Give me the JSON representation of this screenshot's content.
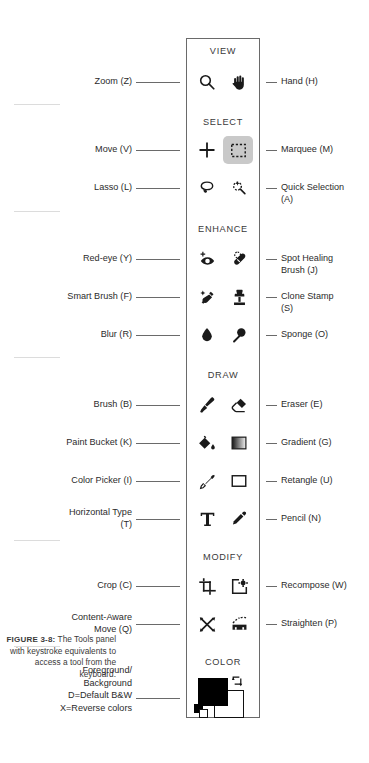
{
  "figure": {
    "number": "FIGURE 3-8:",
    "caption": "The Tools panel with keystroke equivalents to access a tool from the keyboard."
  },
  "panel": {
    "name": "Tools panel",
    "sections": [
      {
        "id": "view",
        "title": "VIEW",
        "rows": [
          {
            "left_label": "Zoom (Z)",
            "left_icon": "magnifier-icon",
            "right_label": "Hand (H)",
            "right_icon": "hand-icon",
            "selected": ""
          }
        ]
      },
      {
        "id": "select",
        "title": "SELECT",
        "rows": [
          {
            "left_label": "Move (V)",
            "left_icon": "move-cross-icon",
            "right_label": "Marquee (M)",
            "right_icon": "marquee-icon",
            "selected": "right"
          },
          {
            "left_label": "Lasso (L)",
            "left_icon": "lasso-icon",
            "right_label": "Quick Selection\n(A)",
            "right_icon": "quick-selection-icon",
            "selected": ""
          }
        ]
      },
      {
        "id": "enhance",
        "title": "ENHANCE",
        "rows": [
          {
            "left_label": "Red-eye (Y)",
            "left_icon": "red-eye-icon",
            "right_label": "Spot Healing\nBrush (J)",
            "right_icon": "spot-healing-brush-icon",
            "selected": ""
          },
          {
            "left_label": "Smart Brush (F)",
            "left_icon": "smart-brush-icon",
            "right_label": "Clone Stamp\n(S)",
            "right_icon": "clone-stamp-icon",
            "selected": ""
          },
          {
            "left_label": "Blur (R)",
            "left_icon": "blur-drop-icon",
            "right_label": "Sponge (O)",
            "right_icon": "sponge-icon",
            "selected": ""
          }
        ]
      },
      {
        "id": "draw",
        "title": "DRAW",
        "rows": [
          {
            "left_label": "Brush (B)",
            "left_icon": "brush-icon",
            "right_label": "Eraser (E)",
            "right_icon": "eraser-icon",
            "selected": ""
          },
          {
            "left_label": "Paint Bucket (K)",
            "left_icon": "paint-bucket-icon",
            "right_label": "Gradient (G)",
            "right_icon": "gradient-icon",
            "selected": ""
          },
          {
            "left_label": "Color Picker (I)",
            "left_icon": "eyedropper-icon",
            "right_label": "Retangle (U)",
            "right_icon": "rectangle-icon",
            "selected": ""
          },
          {
            "left_label": "Horizontal Type\n(T)",
            "left_icon": "type-icon",
            "right_label": "Pencil (N)",
            "right_icon": "pencil-icon",
            "selected": ""
          }
        ]
      },
      {
        "id": "modify",
        "title": "MODIFY",
        "rows": [
          {
            "left_label": "Crop (C)",
            "left_icon": "crop-icon",
            "right_label": "Recompose (W)",
            "right_icon": "recompose-icon",
            "selected": ""
          },
          {
            "left_label": "Content-Aware\nMove (Q)",
            "left_icon": "content-aware-move-icon",
            "right_label": "Straighten (P)",
            "right_icon": "straighten-icon",
            "selected": ""
          }
        ]
      },
      {
        "id": "color",
        "title": "COLOR",
        "rows": []
      }
    ],
    "color_swatch": {
      "label": "Foreground/\nBackground\nD=Default B&W\nX=Reverse colors",
      "foreground_color": "#000000",
      "background_color": "#ffffff",
      "swap_icon": "swap-colors-icon",
      "default_icon": "default-colors-icon"
    }
  },
  "colors": {
    "ink": "#2b2b2b",
    "panel_border": "#6a6a6a",
    "divider": "#dcdcdc",
    "selected_highlight": "#c9c9c9"
  }
}
